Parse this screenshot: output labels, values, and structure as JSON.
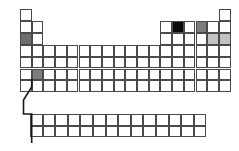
{
  "diagram": {
    "type": "periodic-table",
    "geometry": {
      "origin_x": 20,
      "origin_y": 9,
      "cell_width": 11.7,
      "cell_height": 11.9,
      "main_columns": 18,
      "main_rows": 7,
      "fblock_columns": 14,
      "fblock_rows": 2,
      "fblock_origin_x": 30,
      "fblock_origin_y": 114,
      "fblock_cell_width": 12.6,
      "fblock_cell_height": 11.6
    },
    "colors": {
      "grid_line": "#4a4a4a",
      "background": "#ffffff",
      "fill_dark": "#6e6e6e",
      "fill_black": "#0a0a0a",
      "fill_mid": "#7d7d7d",
      "fill_light": "#c2c2c2",
      "connector": "#1a1a1a"
    },
    "main_grid_cells": [
      {
        "name": "cell-r1c1",
        "row": 1,
        "col": 1,
        "fill": "none"
      },
      {
        "name": "cell-r1c18",
        "row": 1,
        "col": 18,
        "fill": "none"
      },
      {
        "name": "cell-r2c1",
        "row": 2,
        "col": 1,
        "fill": "none"
      },
      {
        "name": "cell-r2c2",
        "row": 2,
        "col": 2,
        "fill": "none"
      },
      {
        "name": "cell-r2c13",
        "row": 2,
        "col": 13,
        "fill": "none"
      },
      {
        "name": "cell-r2c14",
        "row": 2,
        "col": 14,
        "fill": "black"
      },
      {
        "name": "cell-r2c15",
        "row": 2,
        "col": 15,
        "fill": "none"
      },
      {
        "name": "cell-r2c16",
        "row": 2,
        "col": 16,
        "fill": "mid"
      },
      {
        "name": "cell-r2c17",
        "row": 2,
        "col": 17,
        "fill": "none"
      },
      {
        "name": "cell-r2c18",
        "row": 2,
        "col": 18,
        "fill": "none"
      },
      {
        "name": "cell-r3c1",
        "row": 3,
        "col": 1,
        "fill": "dark"
      },
      {
        "name": "cell-r3c2",
        "row": 3,
        "col": 2,
        "fill": "none"
      },
      {
        "name": "cell-r3c13",
        "row": 3,
        "col": 13,
        "fill": "none"
      },
      {
        "name": "cell-r3c14",
        "row": 3,
        "col": 14,
        "fill": "none"
      },
      {
        "name": "cell-r3c15",
        "row": 3,
        "col": 15,
        "fill": "none"
      },
      {
        "name": "cell-r3c16",
        "row": 3,
        "col": 16,
        "fill": "none"
      },
      {
        "name": "cell-r3c17",
        "row": 3,
        "col": 17,
        "fill": "light"
      },
      {
        "name": "cell-r3c18",
        "row": 3,
        "col": 18,
        "fill": "light"
      },
      {
        "name": "cell-r6c2",
        "row": 6,
        "col": 2,
        "fill": "mid"
      }
    ],
    "highlighted_summary": [
      {
        "label": "row-3-col-1",
        "shade": "dark"
      },
      {
        "label": "row-6-col-2",
        "shade": "mid"
      },
      {
        "label": "row-2-col-14",
        "shade": "black"
      },
      {
        "label": "row-2-col-16",
        "shade": "mid"
      },
      {
        "label": "row-3-col-17",
        "shade": "light"
      },
      {
        "label": "row-3-col-18",
        "shade": "light"
      }
    ],
    "connector_path": "M 31.7 78.5 L 31.7 87 L 23.5 100 L 23.5 114 L 31.7 114 L 31.7 143"
  }
}
